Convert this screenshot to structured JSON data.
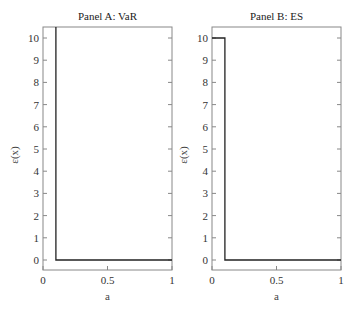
{
  "chart_data": [
    {
      "type": "line",
      "title": "Panel A: VaR",
      "xlabel": "a",
      "ylabel": "ε(x)",
      "xlim": [
        0,
        1
      ],
      "ylim": [
        -0.4,
        10.5
      ],
      "xticks": [
        "0",
        "0.5",
        "1"
      ],
      "yticks": [
        "0",
        "1",
        "2",
        "3",
        "4",
        "5",
        "6",
        "7",
        "8",
        "9",
        "10"
      ],
      "grid": false,
      "series": [
        {
          "name": "VaR",
          "x": [
            0.1,
            0.1,
            1.0
          ],
          "y": [
            10.5,
            0,
            0
          ]
        }
      ]
    },
    {
      "type": "line",
      "title": "Panel B: ES",
      "xlabel": "a",
      "ylabel": "ε(x)",
      "xlim": [
        0,
        1
      ],
      "ylim": [
        -0.4,
        10.5
      ],
      "xticks": [
        "0",
        "0.5",
        "1"
      ],
      "yticks": [
        "0",
        "1",
        "2",
        "3",
        "4",
        "5",
        "6",
        "7",
        "8",
        "9",
        "10"
      ],
      "grid": false,
      "series": [
        {
          "name": "ES",
          "x": [
            0.0,
            0.1,
            0.1,
            1.0
          ],
          "y": [
            10,
            10,
            0,
            0
          ]
        }
      ]
    }
  ],
  "panels": {
    "a": {
      "title": "Panel A: VaR",
      "xlabel": "a",
      "ylabel": "ε(x)"
    },
    "b": {
      "title": "Panel B: ES",
      "xlabel": "a",
      "ylabel": "ε(x)"
    }
  },
  "ticks": {
    "x": [
      "0",
      "0.5",
      "1"
    ],
    "y": [
      "0",
      "1",
      "2",
      "3",
      "4",
      "5",
      "6",
      "7",
      "8",
      "9",
      "10"
    ]
  },
  "colors": {
    "line": "#222222",
    "frame": "#888888"
  }
}
